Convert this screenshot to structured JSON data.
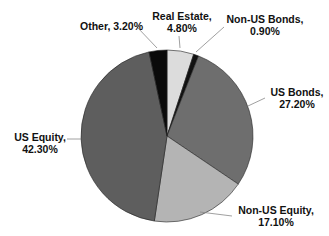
{
  "chart_data": {
    "type": "pie",
    "title": "",
    "start_angle_deg": 0,
    "direction": "clockwise",
    "categories": [
      "Real Estate",
      "Non-US Bonds",
      "US Bonds",
      "Non-US Equity",
      "US Equity",
      "Other"
    ],
    "values": [
      4.8,
      0.9,
      27.2,
      17.1,
      42.3,
      3.2
    ],
    "value_unit": "%",
    "colors": [
      "#dcdcdc",
      "#111111",
      "#6e6e6e",
      "#b4b4b4",
      "#5e5e5e",
      "#0a0a0a"
    ],
    "labels": [
      {
        "name": "Real Estate,",
        "value": "4.80%"
      },
      {
        "name": "Non-US Bonds,",
        "value": "0.90%"
      },
      {
        "name": "US Bonds,",
        "value": "27.20%"
      },
      {
        "name": "Non-US Equity,",
        "value": "17.10%"
      },
      {
        "name": "US Equity,",
        "value": "42.30%"
      },
      {
        "name": "Other, 3.20%",
        "value": ""
      }
    ],
    "legend": "none",
    "grid": false
  }
}
